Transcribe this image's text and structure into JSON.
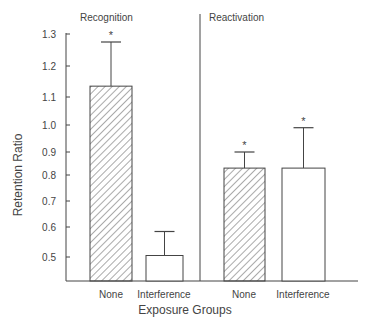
{
  "chart_data": {
    "type": "bar",
    "title": "",
    "xlabel": "Exposure Groups",
    "ylabel": "Retention Ratio",
    "yticks": [
      0.5,
      0.6,
      0.7,
      0.8,
      0.9,
      1.0,
      1.1,
      1.2,
      1.3
    ],
    "ytick_labels": [
      "0.5",
      "0.6",
      "0.7",
      "0.8",
      "0.9",
      "1.0",
      "1.1",
      "1.2",
      "1.3"
    ],
    "ylim": [
      0.42,
      1.3
    ],
    "grid": false,
    "legend": null,
    "panels": [
      {
        "title": "Recognition",
        "categories": [
          "None",
          "Interference"
        ],
        "values": [
          1.135,
          0.505
        ],
        "error_upper": [
          1.275,
          0.585
        ],
        "patterns": [
          "hatched",
          "open"
        ],
        "significant": [
          true,
          false
        ]
      },
      {
        "title": "Reactivation",
        "categories": [
          "None",
          "Interference"
        ],
        "values": [
          0.83,
          0.83
        ],
        "error_upper": [
          0.9,
          0.99
        ],
        "patterns": [
          "hatched",
          "open"
        ],
        "significant": [
          true,
          true
        ]
      }
    ],
    "significance_marker": "*"
  }
}
